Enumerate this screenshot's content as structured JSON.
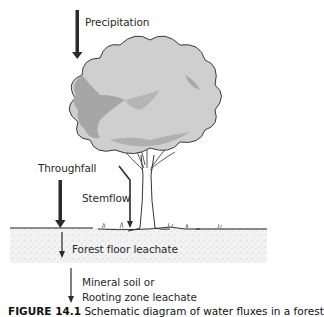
{
  "figure": {
    "labels": {
      "precipitation": "Precipitation",
      "throughfall": "Throughfall",
      "stemflow": "Stemflow",
      "forest_floor": "Forest floor leachate",
      "mineral_soil_line1": "Mineral soil or",
      "mineral_soil_line2": "Rooting zone leachate"
    },
    "caption": {
      "prefix": "FIGURE 14.1",
      "text": "Schematic diagram of water fluxes in a forest"
    },
    "colors": {
      "arrow": "#2b2b2b",
      "canopy_light": "#c9c9c9",
      "canopy_dark": "#9a9a9a",
      "canopy_outline": "#3a3a3a",
      "soil": "#ececec",
      "ground_line": "#222222"
    }
  }
}
